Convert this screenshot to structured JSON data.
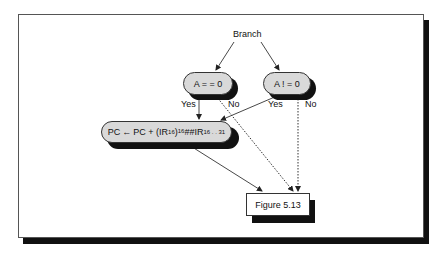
{
  "diagram": {
    "root_label": "Branch",
    "conditions": [
      {
        "label": "A = = 0",
        "yes_label": "Yes",
        "no_label": "No"
      },
      {
        "label": "A ! = 0",
        "yes_label": "Yes",
        "no_label": "No"
      }
    ],
    "action": {
      "lhs": "PC",
      "arrow": "←",
      "rhs_prefix": "PC + (IR",
      "sub1": "16",
      "close_paren": ")",
      "sup1": "16",
      "concat": "##IR",
      "sub2": "16 . . 31"
    },
    "target": {
      "label": "Figure 5.13"
    },
    "edges": [
      {
        "from": "Branch",
        "to": "A == 0",
        "style": "solid-arrow"
      },
      {
        "from": "Branch",
        "to": "A != 0",
        "style": "solid-arrow"
      },
      {
        "from": "A == 0",
        "to": "PC update",
        "label": "Yes",
        "style": "solid-arrow"
      },
      {
        "from": "A == 0",
        "to": "Figure 5.13",
        "label": "No",
        "style": "dotted-arrow"
      },
      {
        "from": "A != 0",
        "to": "PC update",
        "label": "Yes",
        "style": "solid-arrow"
      },
      {
        "from": "A != 0",
        "to": "Figure 5.13",
        "label": "No",
        "style": "dotted-arrow"
      },
      {
        "from": "PC update",
        "to": "Figure 5.13",
        "style": "solid-arrow"
      }
    ],
    "colors": {
      "pill_fill": "#d9d9d9",
      "shadow": "#111111",
      "frame_border": "#555555"
    }
  }
}
